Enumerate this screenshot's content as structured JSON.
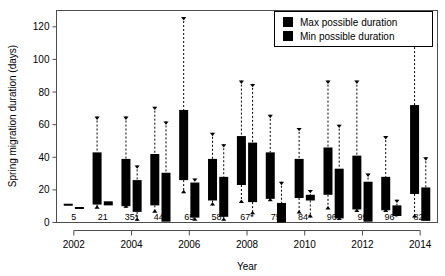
{
  "chart_data": {
    "type": "bar",
    "title": "",
    "subtitle": "",
    "xlabel": "Year",
    "ylabel": "Spring migration duration (days)",
    "xlim": [
      2001.4,
      2014.6
    ],
    "ylim": [
      0,
      130
    ],
    "yticks": [
      0,
      20,
      40,
      60,
      80,
      100,
      120
    ],
    "ytick_labels": [
      "0",
      "20",
      "40",
      "60",
      "80",
      "100",
      "120"
    ],
    "xticks": [
      2002,
      2004,
      2006,
      2008,
      2010,
      2012,
      2014
    ],
    "xtick_labels": [
      "2002",
      "2004",
      "2006",
      "2008",
      "2010",
      "2012",
      "2014"
    ],
    "grid": false,
    "legend_position": "top-right",
    "legend": [
      {
        "name": "Max possible duration",
        "color": "#000000"
      },
      {
        "name": "Min possible duration",
        "color": "#000000"
      }
    ],
    "categories": [
      2002,
      2003,
      2004,
      2005,
      2006,
      2007,
      2008,
      2009,
      2010,
      2011,
      2012,
      2013,
      2014
    ],
    "sample_size_labels": [
      "5",
      "21",
      "35*",
      "44*",
      "65",
      "58*",
      "67*",
      "75",
      "84*",
      "96*",
      "99",
      "96*",
      "82*"
    ],
    "series": [
      {
        "name": "Max possible duration",
        "boxes": [
          {
            "year": 2002,
            "box_low": 10.5,
            "box_high": 11.5,
            "whisker_low": 10.5,
            "whisker_high": 11.5
          },
          {
            "year": 2003,
            "box_low": 11.0,
            "box_high": 43.0,
            "whisker_low": 8.5,
            "whisker_high": 65.0
          },
          {
            "year": 2004,
            "box_low": 10.0,
            "box_high": 39.0,
            "whisker_low": 9.0,
            "whisker_high": 65.0
          },
          {
            "year": 2005,
            "box_low": 10.5,
            "box_high": 42.0,
            "whisker_low": 6.0,
            "whisker_high": 71.0
          },
          {
            "year": 2006,
            "box_low": 26.0,
            "box_high": 69.0,
            "whisker_low": 18.0,
            "whisker_high": 126.0
          },
          {
            "year": 2007,
            "box_low": 13.5,
            "box_high": 39.0,
            "whisker_low": 10.5,
            "whisker_high": 55.0
          },
          {
            "year": 2008,
            "box_low": 23.0,
            "box_high": 53.0,
            "whisker_low": 12.0,
            "whisker_high": 87.0
          },
          {
            "year": 2009,
            "box_low": 14.5,
            "box_high": 43.0,
            "whisker_low": 13.0,
            "whisker_high": 66.0
          },
          {
            "year": 2010,
            "box_low": 15.0,
            "box_high": 39.0,
            "whisker_low": 5.5,
            "whisker_high": 58.0
          },
          {
            "year": 2011,
            "box_low": 17.0,
            "box_high": 46.0,
            "whisker_low": 8.0,
            "whisker_high": 87.0
          },
          {
            "year": 2012,
            "box_low": 8.0,
            "box_high": 41.0,
            "whisker_low": 6.5,
            "whisker_high": 87.0
          },
          {
            "year": 2013,
            "box_low": 7.5,
            "box_high": 28.0,
            "whisker_low": 6.5,
            "whisker_high": 53.0
          },
          {
            "year": 2014,
            "box_low": 17.5,
            "box_high": 72.0,
            "whisker_low": 3.0,
            "whisker_high": 110.0
          }
        ]
      },
      {
        "name": "Min possible duration",
        "boxes": [
          {
            "year": 2002,
            "box_low": 8.5,
            "box_high": 9.5,
            "whisker_low": 8.5,
            "whisker_high": 9.5
          },
          {
            "year": 2003,
            "box_low": 10.5,
            "box_high": 13.0,
            "whisker_low": 10.5,
            "whisker_high": 13.0
          },
          {
            "year": 2004,
            "box_low": 6.5,
            "box_high": 26.0,
            "whisker_low": 1.0,
            "whisker_high": 35.0
          },
          {
            "year": 2005,
            "box_low": 0.5,
            "box_high": 30.5,
            "whisker_low": 0.5,
            "whisker_high": 62.0
          },
          {
            "year": 2006,
            "box_low": 3.0,
            "box_high": 24.5,
            "whisker_low": 1.0,
            "whisker_high": 27.0
          },
          {
            "year": 2007,
            "box_low": 3.5,
            "box_high": 28.0,
            "whisker_low": 1.0,
            "whisker_high": 48.0
          },
          {
            "year": 2008,
            "box_low": 12.5,
            "box_high": 49.0,
            "whisker_low": 5.0,
            "whisker_high": 85.0
          },
          {
            "year": 2009,
            "box_low": 0.0,
            "box_high": 12.0,
            "whisker_low": 0.0,
            "whisker_high": 25.0
          },
          {
            "year": 2010,
            "box_low": 13.5,
            "box_high": 17.0,
            "whisker_low": 3.0,
            "whisker_high": 20.0
          },
          {
            "year": 2011,
            "box_low": 2.5,
            "box_high": 33.0,
            "whisker_low": 1.5,
            "whisker_high": 60.0
          },
          {
            "year": 2012,
            "box_low": 0.5,
            "box_high": 25.0,
            "whisker_low": 0.5,
            "whisker_high": 30.0
          },
          {
            "year": 2013,
            "box_low": 4.0,
            "box_high": 10.5,
            "whisker_low": 4.0,
            "whisker_high": 14.0
          },
          {
            "year": 2014,
            "box_low": 1.0,
            "box_high": 21.5,
            "whisker_low": 1.0,
            "whisker_high": 40.0
          }
        ]
      }
    ]
  }
}
